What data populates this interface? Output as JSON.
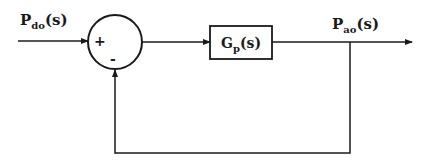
{
  "diagram": {
    "type": "block-diagram",
    "input": {
      "label_main": "P",
      "label_sub": "do",
      "label_arg": "(s)"
    },
    "output": {
      "label_main": "P",
      "label_sub": "ao",
      "label_arg": "(s)"
    },
    "summing_junction": {
      "plus_sign": "+",
      "minus_sign": "-"
    },
    "plant_block": {
      "label_main": "G",
      "label_sub": "p",
      "label_arg": "(s)"
    },
    "connections": [
      {
        "from": "input",
        "to": "summing_junction",
        "port": "+"
      },
      {
        "from": "summing_junction",
        "to": "plant_block"
      },
      {
        "from": "plant_block",
        "to": "output"
      },
      {
        "from": "output",
        "to": "summing_junction",
        "port": "-",
        "type": "unity-feedback"
      }
    ],
    "colors": {
      "stroke": "#1a1a1a",
      "background": "#ffffff"
    }
  }
}
